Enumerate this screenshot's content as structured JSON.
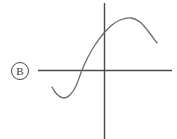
{
  "figure": {
    "choice_label": "B",
    "label_icon": "circled-letter-icon",
    "background_color": "#ffffff",
    "axis_color": "#4a4a4a",
    "curve_color": "#6a6a6a",
    "label_color": "#3a3a3a"
  },
  "chart_data": {
    "type": "line",
    "title": "",
    "xlabel": "",
    "ylabel": "",
    "grid": false,
    "legend": "none",
    "axes": {
      "x_axis": {
        "y_pixel": 70,
        "x_start_pixel": 38,
        "x_end_pixel": 172
      },
      "y_axis": {
        "x_pixel": 104,
        "y_start_pixel": 3,
        "y_end_pixel": 139
      },
      "origin_pixel": [
        104,
        70
      ]
    },
    "series": [
      {
        "name": "curve",
        "points_pixel": [
          [
            52,
            87
          ],
          [
            55,
            92
          ],
          [
            59,
            96
          ],
          [
            64,
            98
          ],
          [
            70,
            95
          ],
          [
            76,
            86
          ],
          [
            82,
            70
          ],
          [
            88,
            57
          ],
          [
            95,
            45
          ],
          [
            104,
            33
          ],
          [
            112,
            25
          ],
          [
            120,
            20
          ],
          [
            131,
            18
          ],
          [
            140,
            22
          ],
          [
            148,
            31
          ],
          [
            157,
            43
          ]
        ],
        "local_minimum_pixel": [
          64,
          98
        ],
        "local_maximum_pixel": [
          131,
          18
        ],
        "x_axis_crossing_pixel": [
          82,
          70
        ],
        "y_axis_crossing_pixel": [
          104,
          33
        ]
      }
    ]
  }
}
